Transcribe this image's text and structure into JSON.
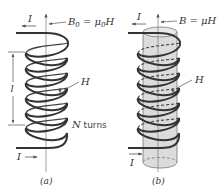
{
  "figure": {
    "panel_a": {
      "caption": "(a)",
      "current_top_label": "I",
      "current_bottom_label": "I",
      "field_label_B": "B",
      "field_label_sub": "0",
      "field_label_eq": " = μ",
      "field_label_mu_sub": "0",
      "field_label_H": "H",
      "h_label": "H",
      "length_label": "l",
      "turns_label_N": "N",
      "turns_label_text": " turns"
    },
    "panel_b": {
      "caption": "(b)",
      "current_top_label": "I",
      "current_bottom_label": "I",
      "field_label": "B = μH",
      "h_label": "H"
    },
    "colors": {
      "coil": "#333333",
      "axis": "#888888",
      "core_fill": "#dcdcdc",
      "core_edge": "#777777",
      "text": "#333333"
    }
  }
}
